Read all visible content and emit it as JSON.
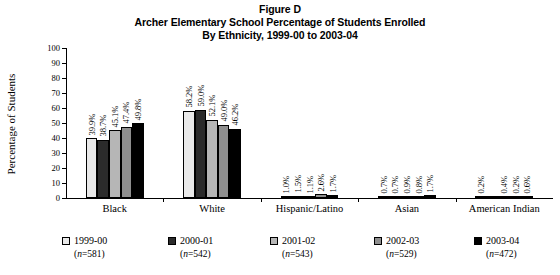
{
  "title": {
    "line1": "Figure D",
    "line2": "Archer Elementary School Percentage of Students Enrolled",
    "line3": "By Ethnicity, 1999-00 to 2003-04"
  },
  "axes": {
    "ylabel": "Percentage of Students",
    "yticks": [
      "100",
      "90",
      "80",
      "70",
      "60",
      "50",
      "40",
      "30",
      "20",
      "10",
      "0"
    ],
    "ymin": 0,
    "ymax": 100
  },
  "legend": [
    {
      "label": "1999-00",
      "n": "(n=581)",
      "n_prefix": "(",
      "n_italic": "n",
      "n_suffix": "=581)",
      "color": "#e9e9e9"
    },
    {
      "label": "2000-01",
      "n": "(n=542)",
      "n_prefix": "(",
      "n_italic": "n",
      "n_suffix": "=542)",
      "color": "#2b2b2b"
    },
    {
      "label": "2001-02",
      "n": "(n=543)",
      "n_prefix": "(",
      "n_italic": "n",
      "n_suffix": "=543)",
      "color": "#b6b6b6"
    },
    {
      "label": "2002-03",
      "n": "(n=529)",
      "n_prefix": "(",
      "n_italic": "n",
      "n_suffix": "=529)",
      "color": "#8f8f8f"
    },
    {
      "label": "2003-04",
      "n": "(n=472)",
      "n_prefix": "(",
      "n_italic": "n",
      "n_suffix": "=472)",
      "color": "#000000"
    }
  ],
  "chart_data": {
    "type": "bar",
    "title": "Archer Elementary School Percentage of Students Enrolled By Ethnicity, 1999-00 to 2003-04",
    "xlabel": "",
    "ylabel": "Percentage of Students",
    "ylim": [
      0,
      100
    ],
    "ytick_step": 10,
    "grid": false,
    "legend_position": "bottom",
    "categories": [
      "Black",
      "White",
      "Hispanic/Latino",
      "Asian",
      "American Indian"
    ],
    "series": [
      {
        "name": "1999-00",
        "color": "#e9e9e9",
        "values": [
          39.9,
          58.2,
          1.0,
          0.7,
          0.2
        ],
        "labels": [
          "39.9%",
          "58.2%",
          "1.0%",
          "0.7%",
          "0.2%"
        ]
      },
      {
        "name": "2000-01",
        "color": "#2b2b2b",
        "values": [
          38.7,
          59.0,
          1.5,
          0.7,
          0.0
        ],
        "labels": [
          "38.7%",
          "59.0%",
          "1.5%",
          "0.7%",
          ""
        ]
      },
      {
        "name": "2001-02",
        "color": "#b6b6b6",
        "values": [
          45.1,
          52.1,
          1.1,
          0.9,
          0.4
        ],
        "labels": [
          "45.1%",
          "52.1%",
          "1.1%",
          "0.9%",
          "0.4%"
        ]
      },
      {
        "name": "2002-03",
        "color": "#8f8f8f",
        "values": [
          47.4,
          49.0,
          2.6,
          0.8,
          0.2
        ],
        "labels": [
          "47.4%",
          "49.0%",
          "2.6%",
          "0.8%",
          "0.2%"
        ]
      },
      {
        "name": "2003-04",
        "color": "#000000",
        "values": [
          49.8,
          46.2,
          1.7,
          1.7,
          0.6
        ],
        "labels": [
          "49.8%",
          "46.2%",
          "1.7%",
          "1.7%",
          "0.6%"
        ]
      }
    ]
  }
}
